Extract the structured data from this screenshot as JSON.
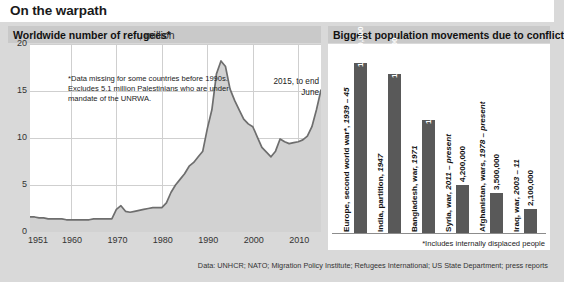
{
  "header": {
    "title": "On the warpath"
  },
  "left_panel": {
    "title_bold": "Worldwide number of refugees*",
    "title_rest": ", million",
    "footnote": "*Data missing for some countries before 1990s. Excludes 5.1 million Palestinians who are under mandate of the UNRWA.",
    "annotation": "2015, to end June"
  },
  "right_panel": {
    "title": "Biggest population movements due to conflict",
    "footnote": "*Includes internally displaced people"
  },
  "source": "Data: UNHCR; NATO; Migration Policy Institute; Refugees International; US State Department; press reports",
  "colors": {
    "page_background": "#d9d9d9",
    "panel_header": "#c9c9c9",
    "plot_background": "#ffffff",
    "area_fill": "#d2d2d2",
    "line": "#6e6e6e",
    "bar": "#595959",
    "gridline": "#cfcfcf"
  },
  "chart_data": [
    {
      "type": "area",
      "id": "worldwide-refugees",
      "title": "Worldwide number of refugees*, million",
      "xlabel": "",
      "ylabel": "million",
      "xlim": [
        1951,
        2015
      ],
      "ylim": [
        0,
        20
      ],
      "yticks": [
        0,
        5,
        10,
        15,
        20
      ],
      "xticks": [
        1951,
        1960,
        1970,
        1980,
        1990,
        2000,
        2010
      ],
      "xtick_labels": [
        "1951",
        "1960",
        "1970",
        "1980",
        "1990",
        "2000",
        "2010"
      ],
      "ytick_labels": [
        "0",
        "5",
        "10",
        "15",
        "20"
      ],
      "grid": true,
      "legend": "none",
      "annotations": [
        {
          "text": "2015, to end June",
          "x": 2015,
          "y": 18.5
        },
        {
          "text": "*Data missing for some countries before 1990s. Excludes 5.1 million Palestinians who are under mandate of the UNRWA.",
          "x": 1957,
          "y": 18
        }
      ],
      "x": [
        1951,
        1952,
        1953,
        1954,
        1955,
        1956,
        1957,
        1958,
        1959,
        1960,
        1961,
        1962,
        1963,
        1964,
        1965,
        1966,
        1967,
        1968,
        1969,
        1970,
        1971,
        1972,
        1973,
        1974,
        1975,
        1976,
        1977,
        1978,
        1979,
        1980,
        1981,
        1982,
        1983,
        1984,
        1985,
        1986,
        1987,
        1988,
        1989,
        1990,
        1991,
        1992,
        1993,
        1994,
        1995,
        1996,
        1997,
        1998,
        1999,
        2000,
        2001,
        2002,
        2003,
        2004,
        2005,
        2006,
        2007,
        2008,
        2009,
        2010,
        2011,
        2012,
        2013,
        2014,
        2015
      ],
      "values": [
        1.6,
        1.6,
        1.5,
        1.5,
        1.4,
        1.4,
        1.4,
        1.4,
        1.3,
        1.3,
        1.3,
        1.3,
        1.3,
        1.3,
        1.4,
        1.4,
        1.4,
        1.4,
        1.4,
        2.4,
        2.8,
        2.2,
        2.1,
        2.2,
        2.3,
        2.4,
        2.5,
        2.6,
        2.6,
        2.6,
        3.1,
        4.2,
        5.0,
        5.6,
        6.2,
        7.0,
        7.4,
        8.0,
        8.6,
        11.0,
        13.0,
        16.8,
        18.2,
        17.6,
        15.2,
        14.0,
        13.0,
        12.0,
        11.5,
        11.2,
        10.1,
        9.0,
        8.5,
        8.0,
        8.6,
        9.9,
        9.6,
        9.4,
        9.5,
        9.6,
        9.8,
        10.2,
        11.2,
        13.0,
        15.1
      ],
      "units": "million"
    },
    {
      "type": "bar",
      "id": "biggest-population-movements",
      "title": "Biggest population movements due to conflict",
      "xlabel": "",
      "ylabel": "",
      "grid": false,
      "legend": "none",
      "note": "*Includes internally displaced people",
      "categories": [
        "Europe, second world war*, 1939 – 45",
        "India, partition, 1947",
        "Bangladesh, war, 1971",
        "Syria, war, 2011 – present",
        "Afghanistan, wars, 1978 – present",
        "Iraq, war, 2003 – 11"
      ],
      "category_parts": [
        {
          "plain": "Europe, second world war*, ",
          "italic": "1939 – 45"
        },
        {
          "plain": "India, partition, ",
          "italic": "1947"
        },
        {
          "plain": "Bangladesh, war, ",
          "italic": "1971"
        },
        {
          "plain": "Syria, war, ",
          "italic": "2011 – present"
        },
        {
          "plain": "Afghanistan, wars, ",
          "italic": "1978 – present"
        },
        {
          "plain": "Iraq, war, ",
          "italic": "2003 – 11"
        }
      ],
      "values": [
        15000000,
        14000000,
        10000000,
        4200000,
        3500000,
        2100000
      ],
      "value_labels": [
        "15,000,000",
        "14,000,000",
        "10,000,000",
        "4,200,000",
        "3,500,000",
        "2,100,000"
      ],
      "ylim": [
        0,
        15000000
      ]
    }
  ]
}
